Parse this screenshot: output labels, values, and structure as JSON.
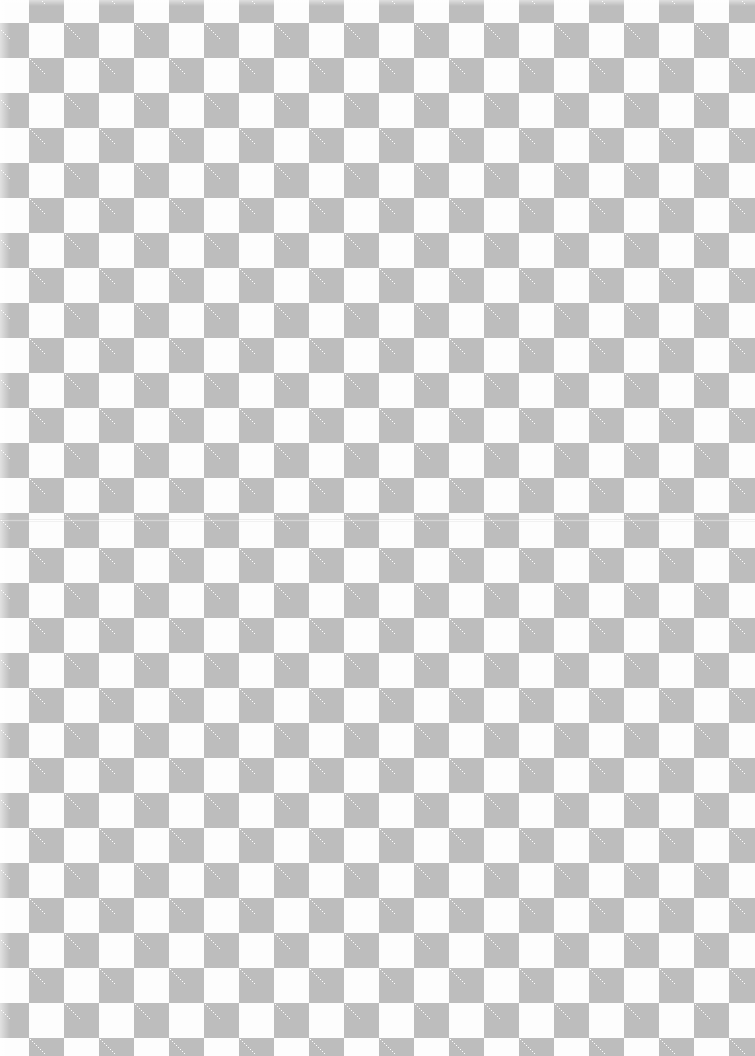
{
  "image": {
    "description": "Scanned sheet with gray and white checkerboard pattern",
    "pattern": {
      "type": "checkerboard",
      "square_size_px": 35,
      "colors": {
        "gray": "#bdbdbd",
        "white": "#fdfdfd"
      },
      "columns_visible": 22,
      "rows_visible": 31
    },
    "fold_line_y": 520
  }
}
